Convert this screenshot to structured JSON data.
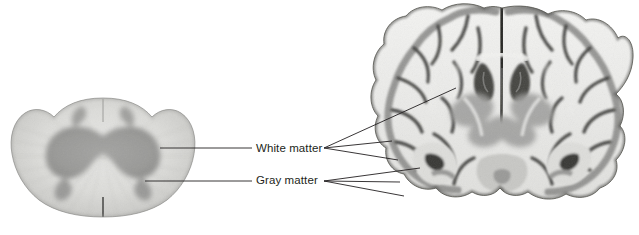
{
  "figure": {
    "background_color": "#ffffff",
    "width": 639,
    "height": 235
  },
  "labels": {
    "white_matter": "White matter",
    "gray_matter": "Gray matter",
    "text_color": "#231f20",
    "font_size_px": 11.5
  },
  "specimens": [
    {
      "id": "spinal-cord",
      "name": "spinal cord cross section",
      "description": "Grayscale histological cross section of spinal cord showing butterfly-shaped central gray matter surrounded by lighter white matter",
      "position": {
        "x": 8,
        "y": 96,
        "width": 190,
        "height": 122
      }
    },
    {
      "id": "brain-coronal",
      "name": "coronal brain section",
      "description": "Grayscale coronal section of human cerebrum showing folded cortical gray matter, interior white matter, ventricles and deep gray nuclei",
      "position": {
        "x": 368,
        "y": 2,
        "width": 268,
        "height": 218
      }
    }
  ],
  "leader_lines": {
    "stroke_color": "#231f20",
    "stroke_width": 0.9,
    "white_matter": [
      {
        "from": [
          160,
          148
        ],
        "to": [
          252,
          148
        ]
      },
      {
        "from": [
          324,
          148
        ],
        "to": [
          456,
          88
        ]
      },
      {
        "from": [
          324,
          148
        ],
        "to": [
          392,
          141
        ]
      },
      {
        "from": [
          324,
          148
        ],
        "to": [
          398,
          160
        ]
      }
    ],
    "gray_matter": [
      {
        "from": [
          145,
          181
        ],
        "to": [
          252,
          181
        ]
      },
      {
        "from": [
          324,
          181
        ],
        "to": [
          420,
          168
        ]
      },
      {
        "from": [
          324,
          181
        ],
        "to": [
          400,
          182
        ]
      },
      {
        "from": [
          324,
          181
        ],
        "to": [
          404,
          196
        ]
      }
    ]
  },
  "palette": {
    "ink": "#231f20",
    "tissue_light": "#f2f2f2",
    "tissue_mid": "#a8a8a8",
    "tissue_dark": "#3a3a3a",
    "white_matter_tone": "#e8e8e6",
    "gray_matter_tone": "#9b9b9b"
  }
}
